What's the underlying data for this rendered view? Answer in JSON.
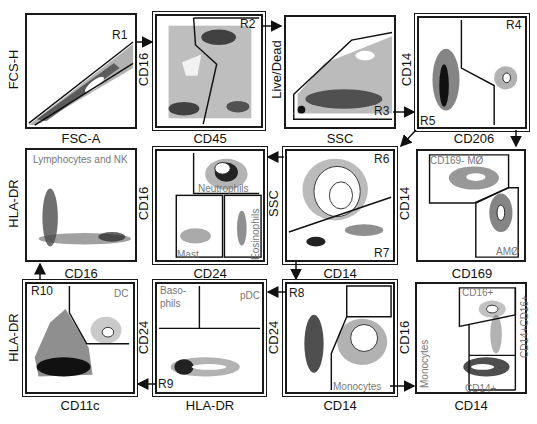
{
  "figure": {
    "type": "flow-cytometry-gating-strategy",
    "panels": [
      {
        "id": 1,
        "x_axis": "FSC-A",
        "y_axis": "FCS-H",
        "gates": [
          "R1"
        ],
        "populations": []
      },
      {
        "id": 2,
        "x_axis": "CD45",
        "y_axis": "CD16",
        "gates": [
          "R2"
        ],
        "populations": []
      },
      {
        "id": 3,
        "x_axis": "SSC",
        "y_axis": "Live/Dead",
        "gates": [
          "R3"
        ],
        "populations": []
      },
      {
        "id": 4,
        "x_axis": "CD206",
        "y_axis": "CD14",
        "gates": [
          "R4",
          "R5"
        ],
        "populations": []
      },
      {
        "id": 5,
        "x_axis": "CD16",
        "y_axis": "HLA-DR",
        "gates": [],
        "populations": [
          "Lymphocytes and NK"
        ]
      },
      {
        "id": 6,
        "x_axis": "CD24",
        "y_axis": "CD16",
        "gates": [],
        "populations": [
          "Neutrophils",
          "Mast",
          "Eosinophils"
        ]
      },
      {
        "id": 7,
        "x_axis": "CD14",
        "y_axis": "SSC",
        "gates": [
          "R6",
          "R7"
        ],
        "populations": []
      },
      {
        "id": 8,
        "x_axis": "CD169",
        "y_axis": "CD14",
        "gates": [],
        "populations": [
          "CD169- MØ",
          "AMØ"
        ]
      },
      {
        "id": 9,
        "x_axis": "CD11c",
        "y_axis": "HLA-DR",
        "gates": [
          "R10"
        ],
        "populations": [
          "DC"
        ]
      },
      {
        "id": 10,
        "x_axis": "HLA-DR",
        "y_axis": "CD24",
        "gates": [
          "R9"
        ],
        "populations": [
          "Baso-",
          "phils",
          "pDC"
        ]
      },
      {
        "id": 11,
        "x_axis": "CD14",
        "y_axis": "CD24",
        "gates": [
          "R8"
        ],
        "populations": [
          "Monocytes"
        ]
      },
      {
        "id": 12,
        "x_axis": "CD14",
        "y_axis": "CD16",
        "gates": [],
        "populations": [
          "Monocytes",
          "CD16+",
          "CD14+CD16+",
          "CD14+"
        ]
      }
    ]
  },
  "labels": {
    "p1": {
      "x": "FSC-A",
      "y": "FCS-H",
      "r1": "R1"
    },
    "p2": {
      "x": "CD45",
      "y": "CD16",
      "r2": "R2"
    },
    "p3": {
      "x": "SSC",
      "y": "Live/Dead",
      "r3": "R3"
    },
    "p4": {
      "x": "CD206",
      "y": "CD14",
      "r4": "R4",
      "r5": "R5"
    },
    "p5": {
      "x": "CD16",
      "y": "HLA-DR",
      "pop": "Lymphocytes and NK"
    },
    "p6": {
      "x": "CD24",
      "y": "CD16",
      "neut": "Neutrophils",
      "mast": "Mast",
      "eos": "Eosinophils"
    },
    "p7": {
      "x": "CD14",
      "y": "SSC",
      "r6": "R6",
      "r7": "R7"
    },
    "p8": {
      "x": "CD169",
      "y": "CD14",
      "mo": "CD169- MØ",
      "am": "AMØ"
    },
    "p9": {
      "x": "CD11c",
      "y": "HLA-DR",
      "r10": "R10",
      "dc": "DC"
    },
    "p10": {
      "x": "HLA-DR",
      "y": "CD24",
      "r9": "R9",
      "baso1": "Baso-",
      "baso2": "phils",
      "pdc": "pDC"
    },
    "p11": {
      "x": "CD14",
      "y": "CD24",
      "r8": "R8",
      "mono": "Monocytes"
    },
    "p12": {
      "x": "CD14",
      "y": "CD16",
      "mono": "Monocytes",
      "cd16": "CD16+",
      "cd1416": "CD14+CD16+",
      "cd14": "CD14+"
    }
  }
}
